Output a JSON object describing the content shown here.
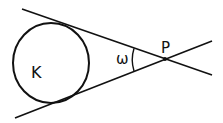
{
  "diagram": {
    "circle": {
      "label": "K",
      "cx": 51,
      "cy": 63,
      "rx": 38,
      "ry": 40
    },
    "point": {
      "label": "P",
      "x": 165,
      "y": 59
    },
    "angle": {
      "label": "ω"
    },
    "lines": [
      {
        "name": "upper-tangent",
        "x1": 22,
        "y1": 9,
        "x2": 212,
        "y2": 75
      },
      {
        "name": "lower-tangent",
        "x1": 15,
        "y1": 118,
        "x2": 212,
        "y2": 41
      }
    ],
    "colors": {
      "stroke": "#111111",
      "background": "#ffffff"
    }
  }
}
